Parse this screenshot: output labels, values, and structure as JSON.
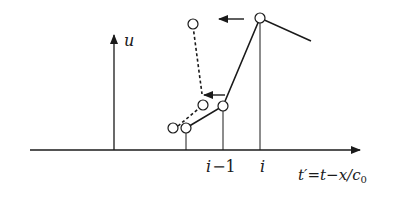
{
  "diagram": {
    "axes": {
      "y_label": "u",
      "x_label_prefix": "t′",
      "x_label_eq": "=",
      "x_label_t": "t",
      "x_label_minus": "−",
      "x_label_x": "x",
      "x_label_slash": "/c",
      "x_label_sub": "0"
    },
    "ticks": {
      "i_minus_1_var": "i",
      "i_minus_1_rest": "−1",
      "i": "i"
    },
    "colors": {
      "stroke": "#1a1a1a",
      "node_fill": "#ffffff"
    }
  }
}
